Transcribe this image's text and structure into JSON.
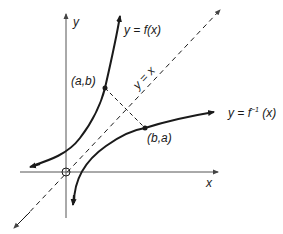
{
  "diagram": {
    "type": "function-and-inverse-graph",
    "colors": {
      "ink": "#1a1a1a",
      "axis": "#555555"
    },
    "axes": {
      "x_label": "x",
      "y_label": "y",
      "origin_label": "O"
    },
    "curves": [
      {
        "id": "f",
        "label": "y = f(x)",
        "style": "solid"
      },
      {
        "id": "f_inverse",
        "label_prefix": "y = f",
        "label_superscript": "−1",
        "label_suffix": " (x)",
        "style": "solid"
      }
    ],
    "reflection_line": {
      "label": "y = x",
      "style": "dashed"
    },
    "points": [
      {
        "label": "(a,b)",
        "on": "f"
      },
      {
        "label": "(b,a)",
        "on": "f_inverse"
      }
    ],
    "connector": {
      "from": "(a,b)",
      "to": "(b,a)",
      "style": "dashed"
    }
  }
}
